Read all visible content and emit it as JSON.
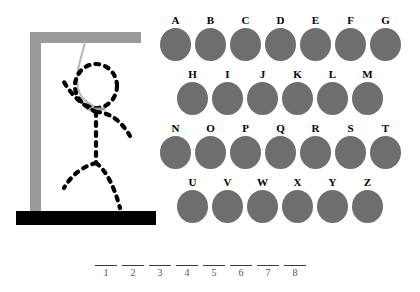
{
  "game": {
    "title": "Hangman",
    "colors": {
      "background": "#ffffff",
      "gallows": "#9a9a9a",
      "base": "#000000",
      "rope": "#b5b5b5",
      "figure": "#000000",
      "letter_disc": "#6e6e6e",
      "letter_text": "#000000",
      "blank_line": "#3a3a3a",
      "blank_number": "#555555"
    }
  },
  "gallows": {
    "name": "hangman-gallows",
    "post_label": "vertical-post",
    "beam_label": "horizontal-beam",
    "base_label": "ground-base",
    "rope_label": "hanging-rope",
    "figure_parts": [
      "head",
      "left-arm",
      "right-arm",
      "torso",
      "left-leg",
      "right-leg"
    ],
    "wrong_guesses": 6
  },
  "letters": {
    "rows": [
      {
        "indent": false,
        "cells": [
          {
            "letter": "A",
            "state": "available"
          },
          {
            "letter": "B",
            "state": "available"
          },
          {
            "letter": "C",
            "state": "available"
          },
          {
            "letter": "D",
            "state": "available"
          },
          {
            "letter": "E",
            "state": "available"
          },
          {
            "letter": "F",
            "state": "available"
          },
          {
            "letter": "G",
            "state": "available"
          }
        ]
      },
      {
        "indent": true,
        "cells": [
          {
            "letter": "H",
            "state": "available"
          },
          {
            "letter": "I",
            "state": "available"
          },
          {
            "letter": "J",
            "state": "available"
          },
          {
            "letter": "K",
            "state": "available"
          },
          {
            "letter": "L",
            "state": "available"
          },
          {
            "letter": "M",
            "state": "available"
          }
        ]
      },
      {
        "indent": false,
        "cells": [
          {
            "letter": "N",
            "state": "available"
          },
          {
            "letter": "O",
            "state": "available"
          },
          {
            "letter": "P",
            "state": "available"
          },
          {
            "letter": "Q",
            "state": "available"
          },
          {
            "letter": "R",
            "state": "available"
          },
          {
            "letter": "S",
            "state": "available"
          },
          {
            "letter": "T",
            "state": "available"
          }
        ]
      },
      {
        "indent": true,
        "cells": [
          {
            "letter": "U",
            "state": "available"
          },
          {
            "letter": "V",
            "state": "available"
          },
          {
            "letter": "W",
            "state": "available"
          },
          {
            "letter": "X",
            "state": "available"
          },
          {
            "letter": "Y",
            "state": "available"
          },
          {
            "letter": "Z",
            "state": "available"
          }
        ]
      }
    ]
  },
  "word": {
    "length": 8,
    "slots": [
      {
        "number": "1",
        "letter": ""
      },
      {
        "number": "2",
        "letter": ""
      },
      {
        "number": "3",
        "letter": ""
      },
      {
        "number": "4",
        "letter": ""
      },
      {
        "number": "5",
        "letter": ""
      },
      {
        "number": "6",
        "letter": ""
      },
      {
        "number": "7",
        "letter": ""
      },
      {
        "number": "8",
        "letter": ""
      }
    ]
  }
}
